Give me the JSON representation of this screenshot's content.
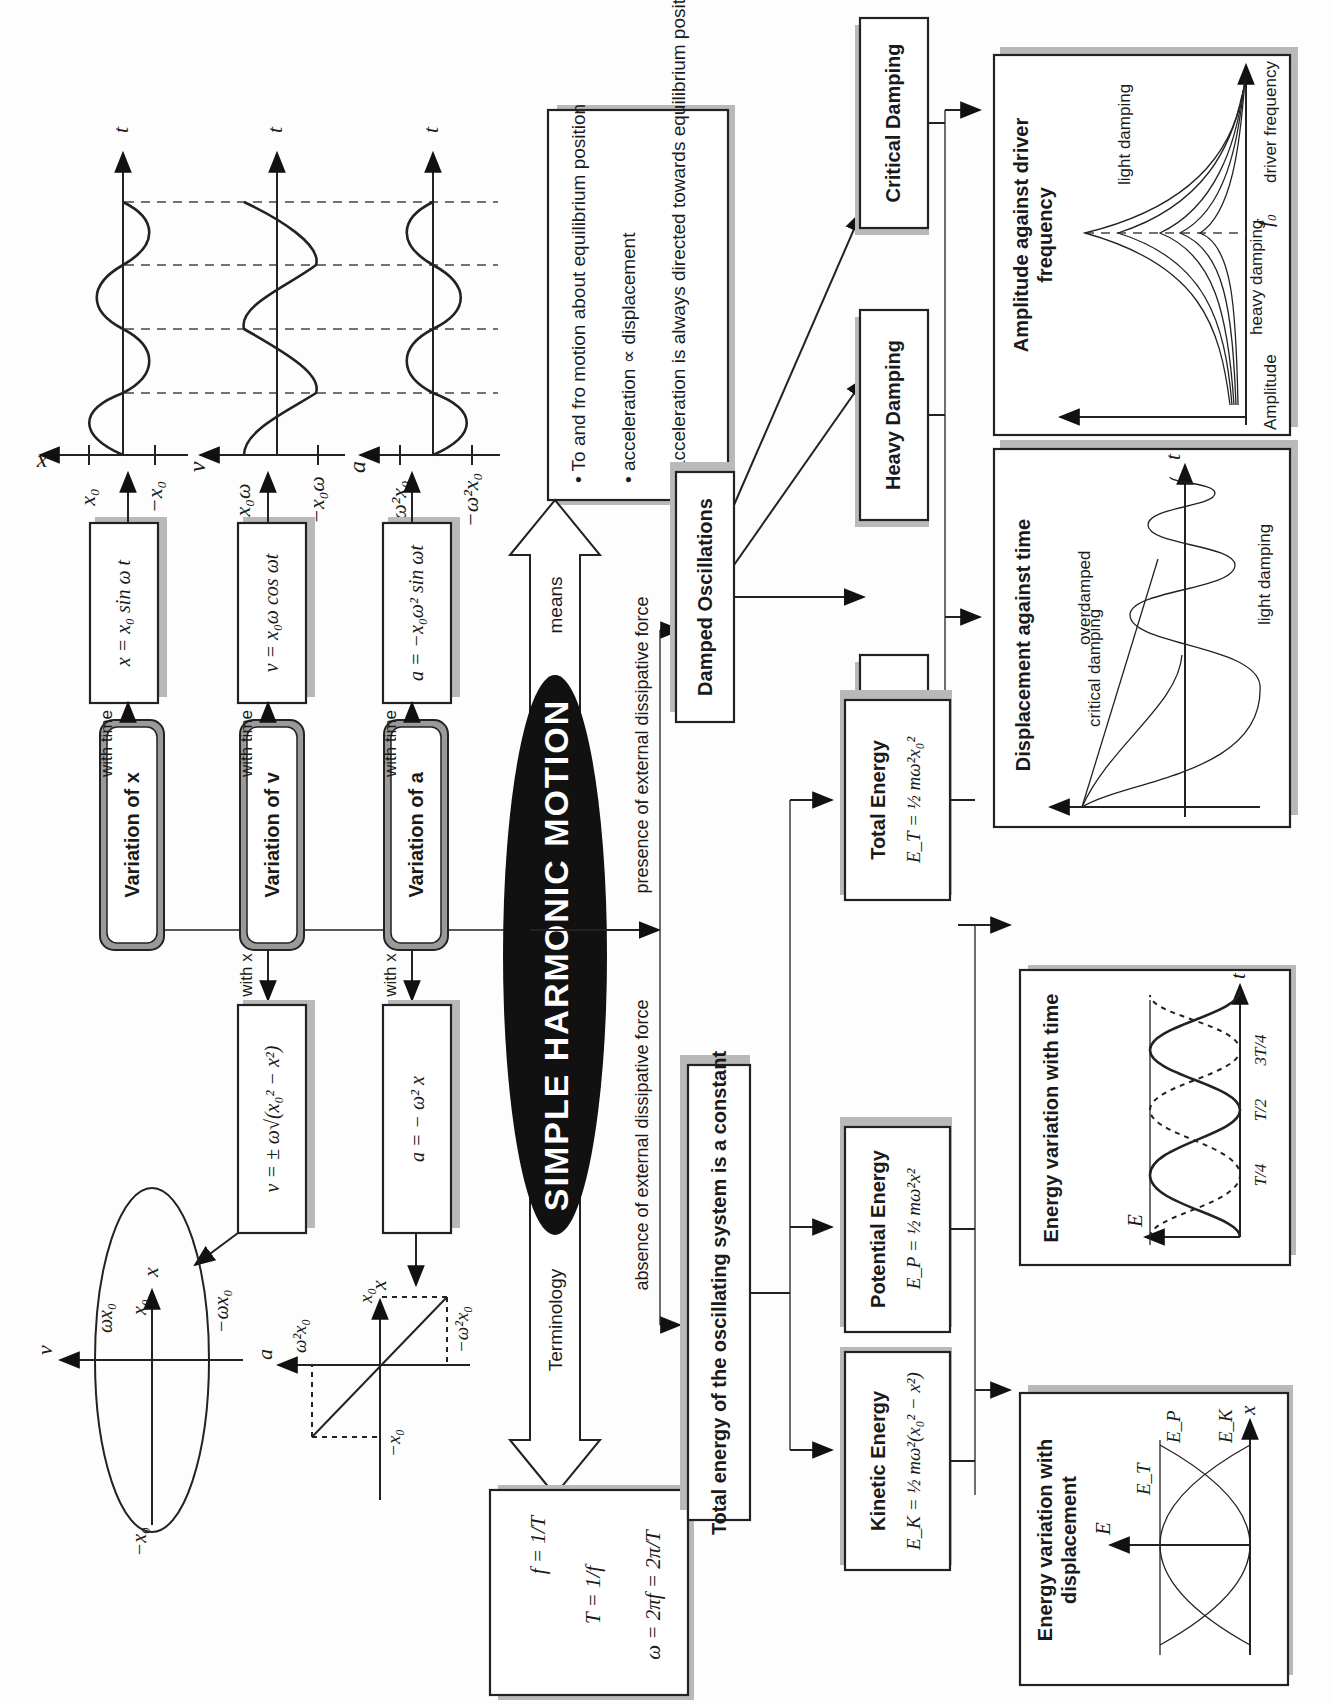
{
  "title": "SIMPLE HARMONIC MOTION",
  "orientation": "rotated 90 degrees counter-clockwise",
  "connector_labels": {
    "means": "means",
    "terminology": "Terminology",
    "absence": "absence of external dissipative force",
    "presence": "presence of external dissipative force",
    "with_time": "with time",
    "with_x": "with x"
  },
  "variations": [
    {
      "label": "Variation of x",
      "time_eq": "x = x₀ sin ω t",
      "x_eq": null
    },
    {
      "label": "Variation of v",
      "time_eq": "v = x₀ω cos ωt",
      "x_eq": "v = ± ω√(x₀² − x²)"
    },
    {
      "label": "Variation of a",
      "time_eq": "a = −x₀ω² sin ωt",
      "x_eq": "a = − ω² x"
    }
  ],
  "time_graphs": [
    {
      "axis": "x",
      "top_tick": "x₀",
      "bottom_tick": "−x₀",
      "time_axis": "t",
      "shape": "sine"
    },
    {
      "axis": "v",
      "top_tick": "x₀ω",
      "bottom_tick": "−x₀ω",
      "time_axis": "t",
      "shape": "cosine"
    },
    {
      "axis": "a",
      "top_tick": "ω²x₀",
      "bottom_tick": "−ω²x₀",
      "time_axis": "t",
      "shape": "negative sine"
    }
  ],
  "definition_box": {
    "bullets": [
      "To and fro motion about equilibrium position",
      "acceleration ∝ displacement",
      "acceleration is always directed towards equilibrium position"
    ]
  },
  "terminology_box": {
    "equations": [
      "f = 1/T",
      "T = 1/f",
      "ω = 2πf = 2π/T"
    ]
  },
  "v_x_graph": {
    "v_axis": "v",
    "x_axis": "x",
    "labels": {
      "v_pos": "ωx₀",
      "v_neg": "−ωx₀",
      "x_pos": "x₀",
      "x_neg": "−x₀"
    },
    "shape": "ellipse"
  },
  "a_x_graph": {
    "a_axis": "a",
    "x_axis": "x",
    "labels": {
      "a_pos": "ω²x₀",
      "a_neg": "−ω²x₀",
      "x_pos": "x₀",
      "x_neg": "−x₀"
    },
    "shape": "straight line through origin, negative gradient"
  },
  "energy": {
    "header": "Total energy of the oscillating system is a constant",
    "boxes": [
      {
        "title": "Kinetic Energy",
        "formula": "E_K = ½ mω²(x₀² − x²)"
      },
      {
        "title": "Potential Energy",
        "formula": "E_P = ½ mω²x²"
      },
      {
        "title": "Total Energy",
        "formula": "E_T = ½ mω²x₀²"
      }
    ],
    "displacement_graph": {
      "title_line1": "Energy variation with",
      "title_line2": "displacement",
      "y_axis": "E",
      "x_axis": "x",
      "curves": [
        "E_T",
        "E_P",
        "E_K"
      ]
    },
    "time_graph": {
      "title": "Energy variation with time",
      "y_axis": "E",
      "x_axis": "t",
      "ticks": [
        "T/4",
        "T/2",
        "3T/4"
      ]
    }
  },
  "damping": {
    "header": "Damped Oscillations",
    "types": [
      "Light Damping",
      "Heavy Damping",
      "Critical Damping"
    ],
    "displacement_graph": {
      "title": "Displacement against time",
      "x_axis": "t",
      "annotations": [
        "critical damping",
        "overdamped",
        "light damping"
      ]
    },
    "resonance_graph": {
      "title_line1": "Amplitude against driver",
      "title_line2": "frequency",
      "y_axis": "Amplitude",
      "x_axis": "driver frequency",
      "marker": "f₀",
      "annotations": [
        "light damping",
        "heavy damping"
      ]
    }
  }
}
